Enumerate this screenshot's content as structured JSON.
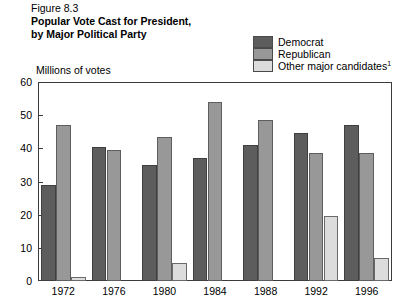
{
  "figure": {
    "number": "Figure 8.3",
    "title_line1": "Popular Vote Cast for President,",
    "title_line2": "by Major Political Party"
  },
  "legend": {
    "items": [
      {
        "label": "Democrat",
        "color": "#5d5d5d"
      },
      {
        "label": "Republican",
        "color": "#989898"
      },
      {
        "label": "Other major candidates",
        "footnote": "1",
        "color": "#dcdcdc"
      }
    ]
  },
  "axis": {
    "y_title": "Millions of votes",
    "y_ticks": [
      "60",
      "50",
      "40",
      "30",
      "20",
      "10",
      "0"
    ],
    "x_ticks": [
      "1972",
      "1976",
      "1980",
      "1984",
      "1988",
      "1992",
      "1996"
    ]
  },
  "chart_data": {
    "type": "bar",
    "title": "Popular Vote Cast for President, by Major Political Party",
    "subtitle": "Figure 8.3",
    "xlabel": "",
    "ylabel": "Millions of votes",
    "ylim": [
      0,
      60
    ],
    "ytick_step": 10,
    "grid": false,
    "legend_position": "top-right",
    "categories": [
      "1972",
      "1976",
      "1980",
      "1984",
      "1988",
      "1992",
      "1996"
    ],
    "series": [
      {
        "name": "Democrat",
        "color": "#5d5d5d",
        "values": [
          29,
          40.5,
          35,
          37,
          41,
          44.5,
          47
        ]
      },
      {
        "name": "Republican",
        "color": "#989898",
        "values": [
          47,
          39.5,
          43.5,
          54,
          48.5,
          38.5,
          38.5
        ]
      },
      {
        "name": "Other major candidates",
        "color": "#dcdcdc",
        "values": [
          1.1,
          0,
          5.5,
          0,
          0,
          19.5,
          7
        ]
      }
    ],
    "footnotes": [
      {
        "marker": "1",
        "applies_to": "Other major candidates"
      }
    ]
  }
}
